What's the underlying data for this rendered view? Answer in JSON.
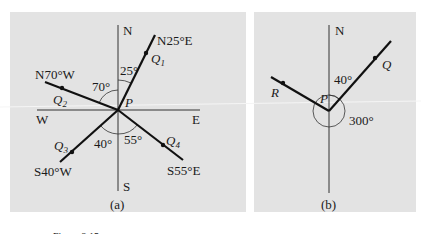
{
  "figure": {
    "caption_partial": "Figure 2.15",
    "panel_a": {
      "label": "(a)",
      "compass": {
        "north": "N",
        "south": "S",
        "east": "E",
        "west": "W"
      },
      "origin": "P",
      "bearings": [
        {
          "point": "Q",
          "sub": "1",
          "bearing": "N25°E",
          "angle": "25°"
        },
        {
          "point": "Q",
          "sub": "2",
          "bearing": "N70°W",
          "angle": "70°"
        },
        {
          "point": "Q",
          "sub": "3",
          "bearing": "S40°W",
          "angle": "40°"
        },
        {
          "point": "Q",
          "sub": "4",
          "bearing": "S55°E",
          "angle": "55°"
        }
      ]
    },
    "panel_b": {
      "label": "(b)",
      "compass": {
        "north": "N"
      },
      "origin": "P",
      "points": {
        "q": "Q",
        "r": "R"
      },
      "angles": {
        "q_angle": "40°",
        "r_angle": "300°"
      }
    }
  },
  "colors": {
    "panel_bg": "#e3e3e3",
    "line": "#111111",
    "axis": "#333333"
  }
}
